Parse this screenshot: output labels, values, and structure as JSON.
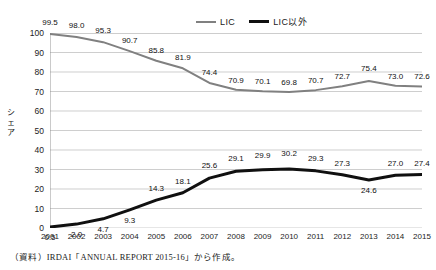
{
  "legend": {
    "position": "top-center",
    "items": [
      {
        "label": "LIC",
        "color": "#808080",
        "style": "thin-gray-line"
      },
      {
        "label": "LIC以外",
        "color": "#101010",
        "style": "thick-black-line"
      }
    ]
  },
  "axis": {
    "y_title_chars": [
      "シ",
      "ェ",
      "ア"
    ],
    "y_ticks": [
      "100",
      "90",
      "80",
      "70",
      "60",
      "50",
      "40",
      "30",
      "20",
      "10",
      "0"
    ]
  },
  "source_note": "（資料）IRDAI「ANNUAL REPORT 2015-16」から作成。",
  "top_strip_text": "",
  "chart_data": {
    "type": "line",
    "title": "",
    "subtitle": "",
    "xlabel": "",
    "ylabel": "シェア",
    "ylim": [
      0,
      100
    ],
    "ytick_step": 10,
    "grid": true,
    "grid_axis": "y",
    "legend_position": "top-center",
    "categories": [
      "2001",
      "2002",
      "2003",
      "2004",
      "2005",
      "2006",
      "2007",
      "2008",
      "2009",
      "2010",
      "2011",
      "2012",
      "2013",
      "2014",
      "2015"
    ],
    "series": [
      {
        "name": "LIC",
        "color": "#808080",
        "width": 2,
        "values": [
          99.5,
          98.0,
          95.3,
          90.7,
          85.8,
          81.9,
          74.4,
          70.9,
          70.1,
          69.8,
          70.7,
          72.7,
          75.4,
          73.0,
          72.6
        ],
        "labels": [
          "99.5",
          "98.0",
          "95.3",
          "90.7",
          "85.8",
          "81.9",
          "74.4",
          "70.9",
          "70.1",
          "69.8",
          "70.7",
          "72.7",
          "75.4",
          "73.0",
          "72.6"
        ]
      },
      {
        "name": "LIC以外",
        "color": "#101010",
        "width": 3,
        "values": [
          0.5,
          2.0,
          4.7,
          9.3,
          14.3,
          18.1,
          25.6,
          29.1,
          29.9,
          30.2,
          29.3,
          27.3,
          24.6,
          27.0,
          27.4
        ],
        "labels": [
          "0.5",
          "2.0",
          "4.7",
          "9.3",
          "14.3",
          "18.1",
          "25.6",
          "29.1",
          "29.9",
          "30.2",
          "29.3",
          "27.3",
          "24.6",
          "27.0",
          "27.4"
        ]
      }
    ]
  }
}
